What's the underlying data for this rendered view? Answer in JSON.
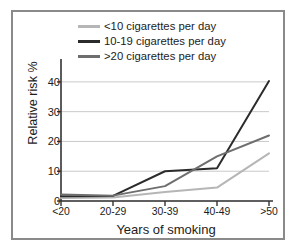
{
  "chart_data": {
    "type": "line",
    "title": "",
    "xlabel": "Years of smoking",
    "ylabel": "Relative risk %",
    "categories": [
      "<20",
      "20-29",
      "30-39",
      "40-49",
      ">50"
    ],
    "ylim": [
      0,
      45
    ],
    "yticks": [
      0,
      10,
      20,
      30,
      40
    ],
    "ytick_labels": [
      "0",
      "10",
      "20",
      "30",
      "40"
    ],
    "grid": "horizontal",
    "legend_position": "top",
    "series": [
      {
        "name": "<10 cigarettes per day",
        "color": "#b6b6b6",
        "values": [
          1.0,
          1.2,
          3.0,
          4.5,
          16.0
        ]
      },
      {
        "name": "10-19 cigarettes per day",
        "color": "#2b2b2b",
        "values": [
          1.6,
          1.7,
          10.0,
          11.0,
          40.3
        ]
      },
      {
        "name": ">20 cigarettes per day",
        "color": "#6e6e6e",
        "values": [
          2.2,
          1.8,
          5.0,
          15.0,
          22.0
        ]
      }
    ]
  },
  "colors": {
    "frame_border": "#8a8a8a",
    "axis": "#333333",
    "gridline": "#c9c9c9",
    "background": "#ffffff",
    "text": "#1c1c1c"
  }
}
